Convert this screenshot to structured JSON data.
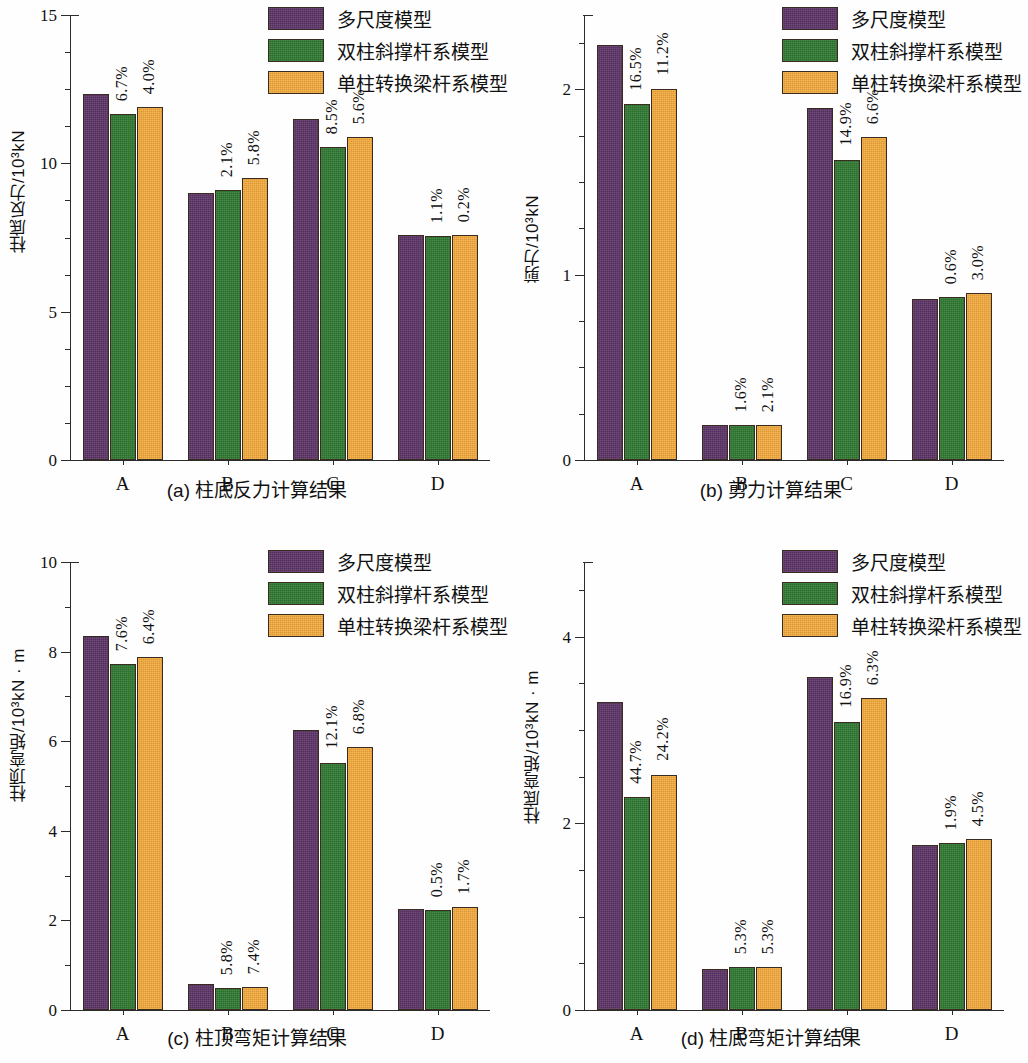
{
  "figure": {
    "series": [
      {
        "key": "multi_scale",
        "label": "多尺度模型",
        "color": "#5e3568"
      },
      {
        "key": "double_column_brace",
        "label": "双柱斜撑杆系模型",
        "color": "#2f7a32"
      },
      {
        "key": "single_column_transfer",
        "label": "单柱转换梁杆系模型",
        "color": "#f6ac3e"
      }
    ]
  },
  "chart_data": [
    {
      "id": "a",
      "type": "bar",
      "title": "(a) 柱底反力计算结果",
      "xlabel": "",
      "ylabel": "柱底反力/10³kN",
      "categories": [
        "A",
        "B",
        "C",
        "D"
      ],
      "ylim": [
        0,
        15
      ],
      "yticks": [
        0,
        5,
        10,
        15
      ],
      "yticklabels": [
        "0",
        "5",
        "10",
        "15"
      ],
      "minor_tick_step": 1.25,
      "grid": false,
      "legend_position": "top-right",
      "series": [
        {
          "name": "多尺度模型",
          "values": [
            12.35,
            9.0,
            11.5,
            7.6
          ]
        },
        {
          "name": "双柱斜撑杆系模型",
          "values": [
            11.65,
            9.1,
            10.55,
            7.55
          ]
        },
        {
          "name": "单柱转换梁杆系模型",
          "values": [
            11.9,
            9.5,
            10.9,
            7.6
          ]
        }
      ],
      "annotations": [
        {
          "category": "A",
          "series": "双柱斜撑杆系模型",
          "text": "6.7%"
        },
        {
          "category": "A",
          "series": "单柱转换梁杆系模型",
          "text": "4.0%"
        },
        {
          "category": "B",
          "series": "双柱斜撑杆系模型",
          "text": "2.1%"
        },
        {
          "category": "B",
          "series": "单柱转换梁杆系模型",
          "text": "5.8%"
        },
        {
          "category": "C",
          "series": "双柱斜撑杆系模型",
          "text": "8.5%"
        },
        {
          "category": "C",
          "series": "单柱转换梁杆系模型",
          "text": "5.6%"
        },
        {
          "category": "D",
          "series": "双柱斜撑杆系模型",
          "text": "1.1%"
        },
        {
          "category": "D",
          "series": "单柱转换梁杆系模型",
          "text": "0.2%"
        }
      ]
    },
    {
      "id": "b",
      "type": "bar",
      "title": "(b) 剪力计算结果",
      "xlabel": "",
      "ylabel": "剪力/10³kN",
      "categories": [
        "A",
        "B",
        "C",
        "D"
      ],
      "ylim": [
        0,
        2.4
      ],
      "yticks": [
        0,
        1,
        2
      ],
      "yticklabels": [
        "0",
        "1",
        "2"
      ],
      "minor_tick_step": 0.25,
      "grid": false,
      "legend_position": "top-right",
      "series": [
        {
          "name": "多尺度模型",
          "values": [
            2.24,
            0.19,
            1.9,
            0.87
          ]
        },
        {
          "name": "双柱斜撑杆系模型",
          "values": [
            1.92,
            0.19,
            1.62,
            0.88
          ]
        },
        {
          "name": "单柱转换梁杆系模型",
          "values": [
            2.0,
            0.19,
            1.74,
            0.9
          ]
        }
      ],
      "annotations": [
        {
          "category": "A",
          "series": "双柱斜撑杆系模型",
          "text": "16.5%"
        },
        {
          "category": "A",
          "series": "单柱转换梁杆系模型",
          "text": "11.2%"
        },
        {
          "category": "B",
          "series": "双柱斜撑杆系模型",
          "text": "1.6%"
        },
        {
          "category": "B",
          "series": "单柱转换梁杆系模型",
          "text": "2.1%"
        },
        {
          "category": "C",
          "series": "双柱斜撑杆系模型",
          "text": "14.9%"
        },
        {
          "category": "C",
          "series": "单柱转换梁杆系模型",
          "text": "6.6%"
        },
        {
          "category": "D",
          "series": "双柱斜撑杆系模型",
          "text": "0.6%"
        },
        {
          "category": "D",
          "series": "单柱转换梁杆系模型",
          "text": "3.0%"
        }
      ]
    },
    {
      "id": "c",
      "type": "bar",
      "title": "(c) 柱顶弯矩计算结果",
      "xlabel": "",
      "ylabel": "柱顶弯矩/10³kN · m",
      "categories": [
        "A",
        "B",
        "C",
        "D"
      ],
      "ylim": [
        0,
        10
      ],
      "yticks": [
        0,
        2,
        4,
        6,
        8,
        10
      ],
      "yticklabels": [
        "0",
        "2",
        "4",
        "6",
        "8",
        "10"
      ],
      "minor_tick_step": 1,
      "grid": false,
      "legend_position": "top-right",
      "series": [
        {
          "name": "多尺度模型",
          "values": [
            8.35,
            0.58,
            6.25,
            2.25
          ]
        },
        {
          "name": "双柱斜撑杆系模型",
          "values": [
            7.72,
            0.5,
            5.52,
            2.24
          ]
        },
        {
          "name": "单柱转换梁杆系模型",
          "values": [
            7.87,
            0.52,
            5.87,
            2.29
          ]
        }
      ],
      "annotations": [
        {
          "category": "A",
          "series": "双柱斜撑杆系模型",
          "text": "7.6%"
        },
        {
          "category": "A",
          "series": "单柱转换梁杆系模型",
          "text": "6.4%"
        },
        {
          "category": "B",
          "series": "双柱斜撑杆系模型",
          "text": "5.8%"
        },
        {
          "category": "B",
          "series": "单柱转换梁杆系模型",
          "text": "7.4%"
        },
        {
          "category": "C",
          "series": "双柱斜撑杆系模型",
          "text": "12.1%"
        },
        {
          "category": "C",
          "series": "单柱转换梁杆系模型",
          "text": "6.8%"
        },
        {
          "category": "D",
          "series": "双柱斜撑杆系模型",
          "text": "0.5%"
        },
        {
          "category": "D",
          "series": "单柱转换梁杆系模型",
          "text": "1.7%"
        }
      ]
    },
    {
      "id": "d",
      "type": "bar",
      "title": "(d) 柱底弯矩计算结果",
      "xlabel": "",
      "ylabel": "柱底弯矩/10³kN · m",
      "categories": [
        "A",
        "B",
        "C",
        "D"
      ],
      "ylim": [
        0,
        4.8
      ],
      "yticks": [
        0,
        2,
        4
      ],
      "yticklabels": [
        "0",
        "2",
        "4"
      ],
      "minor_tick_step": 0.5,
      "grid": false,
      "legend_position": "top-right",
      "series": [
        {
          "name": "多尺度模型",
          "values": [
            3.3,
            0.44,
            3.57,
            1.77
          ]
        },
        {
          "name": "双柱斜撑杆系模型",
          "values": [
            2.28,
            0.46,
            3.09,
            1.79
          ]
        },
        {
          "name": "单柱转换梁杆系模型",
          "values": [
            2.52,
            0.46,
            3.34,
            1.83
          ]
        }
      ],
      "annotations": [
        {
          "category": "A",
          "series": "双柱斜撑杆系模型",
          "text": "44.7%"
        },
        {
          "category": "A",
          "series": "单柱转换梁杆系模型",
          "text": "24.2%"
        },
        {
          "category": "B",
          "series": "双柱斜撑杆系模型",
          "text": "5.3%"
        },
        {
          "category": "B",
          "series": "单柱转换梁杆系模型",
          "text": "5.3%"
        },
        {
          "category": "C",
          "series": "双柱斜撑杆系模型",
          "text": "16.9%"
        },
        {
          "category": "C",
          "series": "单柱转换梁杆系模型",
          "text": "6.3%"
        },
        {
          "category": "D",
          "series": "双柱斜撑杆系模型",
          "text": "1.9%"
        },
        {
          "category": "D",
          "series": "单柱转换梁杆系模型",
          "text": "4.5%"
        }
      ]
    }
  ]
}
